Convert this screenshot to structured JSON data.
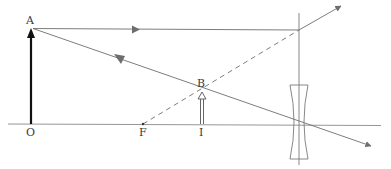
{
  "diagram": {
    "type": "ray-diagram",
    "colors": {
      "line": "#6e6e6e",
      "object_arrow": "#111111",
      "text": "#3a3a3a",
      "background": "#ffffff"
    },
    "labels": {
      "A": "A",
      "B": "B",
      "O": "O",
      "F": "F",
      "I": "I"
    },
    "elements": [
      {
        "id": "optical-axis",
        "kind": "line"
      },
      {
        "id": "object-AO",
        "kind": "solid-arrow",
        "from": "O",
        "to": "A"
      },
      {
        "id": "image-BI",
        "kind": "hollow-arrow",
        "from": "I",
        "to": "B"
      },
      {
        "id": "ray-parallel",
        "kind": "ray",
        "path": "A → lens (parallel to axis) → diverges outward"
      },
      {
        "id": "ray-center",
        "kind": "ray",
        "path": "A → optical center → continues undeviated"
      },
      {
        "id": "virtual-ray",
        "kind": "dashed-line",
        "path": "F → refraction point on lens"
      },
      {
        "id": "lens",
        "kind": "diverging-lens"
      }
    ]
  }
}
